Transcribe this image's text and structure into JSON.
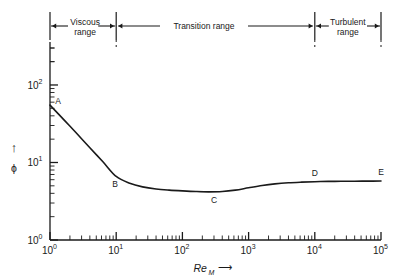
{
  "chart_data": {
    "type": "line",
    "title": "",
    "subtitle": "",
    "xlabel": "Re",
    "xlabel_sub": "M",
    "xlabel_arrow": "⟶",
    "ylabel": "ϕ",
    "ylabel_arrow": "↑",
    "xscale": "log",
    "yscale": "log",
    "xlim": [
      1,
      100000
    ],
    "ylim": [
      1,
      300
    ],
    "grid": false,
    "legend": "none",
    "xticks": [
      {
        "value": 1,
        "label": "10",
        "exp": "0"
      },
      {
        "value": 10,
        "label": "10",
        "exp": "1"
      },
      {
        "value": 100,
        "label": "10",
        "exp": "2"
      },
      {
        "value": 1000,
        "label": "10",
        "exp": "3"
      },
      {
        "value": 10000,
        "label": "10",
        "exp": "4"
      },
      {
        "value": 100000,
        "label": "10",
        "exp": "5"
      }
    ],
    "yticks": [
      {
        "value": 1,
        "label": "10",
        "exp": "0"
      },
      {
        "value": 10,
        "label": "10",
        "exp": "1"
      },
      {
        "value": 100,
        "label": "10",
        "exp": "2"
      }
    ],
    "series": [
      {
        "name": "friction factor curve",
        "x": [
          1,
          1.6,
          2.5,
          4,
          6.3,
          10,
          16,
          25,
          40,
          63,
          100,
          160,
          250,
          400,
          630,
          1000,
          1600,
          2500,
          4000,
          6300,
          10000,
          16000,
          25000,
          40000,
          63000,
          100000
        ],
        "y": [
          55,
          36,
          24,
          15.5,
          10.2,
          6.6,
          5.4,
          4.85,
          4.55,
          4.4,
          4.3,
          4.22,
          4.18,
          4.22,
          4.4,
          4.72,
          5.05,
          5.3,
          5.48,
          5.58,
          5.65,
          5.7,
          5.72,
          5.74,
          5.75,
          5.76
        ]
      }
    ],
    "annotations": [
      {
        "label": "A",
        "x": 1,
        "y": 55
      },
      {
        "label": "B",
        "x": 10,
        "y": 6.6
      },
      {
        "label": "C",
        "x": 300,
        "y": 4.18
      },
      {
        "label": "D",
        "x": 10000,
        "y": 5.65
      },
      {
        "label": "E",
        "x": 100000,
        "y": 5.76
      }
    ]
  },
  "ranges": {
    "items": [
      {
        "id": "viscous",
        "line1": "Viscous",
        "line2": "range",
        "x_start": 1,
        "x_end": 10
      },
      {
        "id": "transition",
        "line1": "Transition range",
        "line2": "",
        "x_start": 10,
        "x_end": 10000
      },
      {
        "id": "turbulent",
        "line1": "Turbulent",
        "line2": "range",
        "x_start": 10000,
        "x_end": 100000
      }
    ]
  },
  "colors": {
    "ink": "#1a1a1a",
    "curve": "#1a1a1a",
    "background": "#ffffff"
  }
}
